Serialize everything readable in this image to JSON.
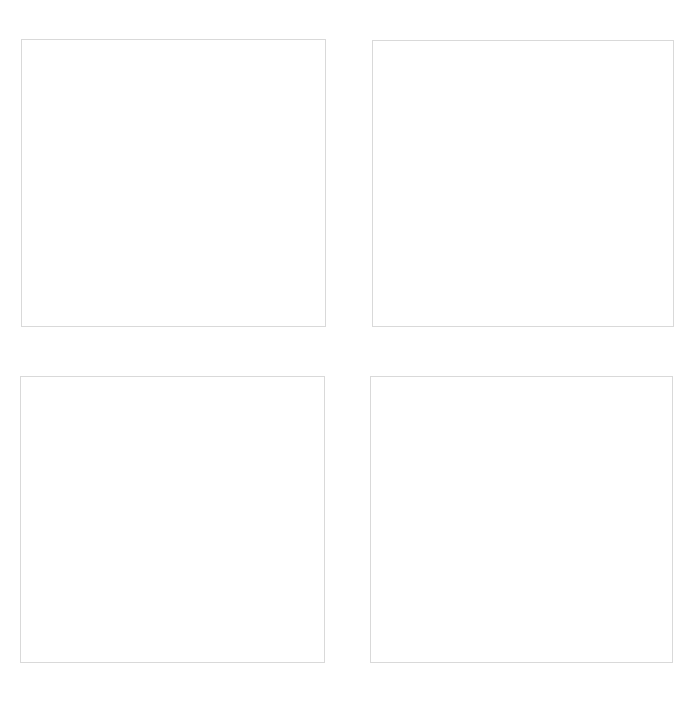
{
  "grid": {
    "rows": 2,
    "columns": 2,
    "border_color": "#d9d9d9",
    "background": "#ffffff",
    "panels": [
      {
        "position": "top-left",
        "content": ""
      },
      {
        "position": "top-right",
        "content": ""
      },
      {
        "position": "bottom-left",
        "content": ""
      },
      {
        "position": "bottom-right",
        "content": ""
      }
    ]
  }
}
